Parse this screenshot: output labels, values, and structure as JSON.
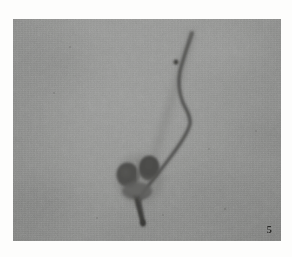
{
  "figure": {
    "kind": "photomicrograph",
    "caption_label": "5",
    "alt": "Grayscale photomicrograph of a bilobed cell head with a long curved flagellar tail",
    "plate": {
      "background_color": "#8e8f8d",
      "page_color": "#fdfdfc",
      "left": 13,
      "top": 19,
      "width": 268,
      "height": 222
    },
    "specimen": {
      "name": "bilobed-cell-with-flagellum",
      "stain_color": "#4a4a48",
      "lobes": [
        {
          "name": "left-lobe",
          "cx": 128,
          "cy": 175,
          "rx": 11,
          "ry": 12
        },
        {
          "name": "right-lobe",
          "cx": 149,
          "cy": 168,
          "rx": 10.5,
          "ry": 12
        }
      ],
      "midpiece": {
        "name": "midpiece",
        "cx": 140,
        "cy": 190
      },
      "basal_stub": {
        "name": "basal-stub",
        "x1": 140,
        "y1": 196,
        "x2": 143,
        "y2": 222
      },
      "flagellum": {
        "name": "flagellum-tail",
        "tip": {
          "x": 192,
          "y": 33
        },
        "path_points": [
          [
            192,
            33
          ],
          [
            188,
            44
          ],
          [
            183,
            56
          ],
          [
            180,
            68
          ],
          [
            180,
            80
          ],
          [
            183,
            92
          ],
          [
            188,
            103
          ],
          [
            191,
            111
          ],
          [
            188,
            120
          ],
          [
            181,
            131
          ],
          [
            172,
            143
          ],
          [
            163,
            155
          ],
          [
            155,
            166
          ],
          [
            148,
            176
          ],
          [
            143,
            186
          ]
        ]
      },
      "debris_speck": {
        "name": "debris-speck",
        "cx": 176,
        "cy": 62,
        "r": 2.2
      }
    }
  }
}
